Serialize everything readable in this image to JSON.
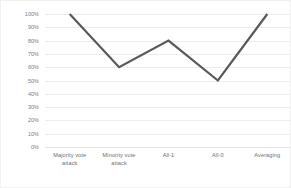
{
  "chart_data": {
    "type": "line",
    "title": "",
    "subtitle": "",
    "xlabel": "",
    "ylabel": "",
    "categories": [
      "Majority vote attack",
      "Minority vote attack",
      "All-1",
      "All-0",
      "Averaging"
    ],
    "values": [
      1.0,
      0.6,
      0.8,
      0.5,
      1.0
    ],
    "value_labels": [
      "100%",
      "60%",
      "80%",
      "50%",
      "100%"
    ],
    "series": [
      {
        "name": "",
        "values": [
          1.0,
          0.6,
          0.8,
          0.5,
          1.0
        ],
        "color": "#595959",
        "line_width": 2.2,
        "markers": false
      }
    ],
    "ylim": [
      0,
      1.0
    ],
    "y_ticks": [
      1.0,
      0.9,
      0.8,
      0.7,
      0.6,
      0.5,
      0.4,
      0.3,
      0.2,
      0.1,
      0.0
    ],
    "y_tick_labels": [
      "100%",
      "90%",
      "80%",
      "70%",
      "60%",
      "50%",
      "40%",
      "30%",
      "20%",
      "10%",
      "0%"
    ],
    "y_tick_format": "percent",
    "grid": true,
    "grid_axis": "y",
    "grid_color": "#e8edf2",
    "baseline_color": "#dfe4e9",
    "legend": false,
    "legend_position": "none",
    "plot_background": "#ffffff",
    "frame_border_color": "#f0f0f0",
    "axis_label_color": "#7a7a7a"
  },
  "x_axis_label_lines": [
    [
      "Majority vote",
      "attack"
    ],
    [
      "Minority vote",
      "attack"
    ],
    [
      "All-1",
      ""
    ],
    [
      "All-0",
      ""
    ],
    [
      "Averaging",
      ""
    ]
  ]
}
